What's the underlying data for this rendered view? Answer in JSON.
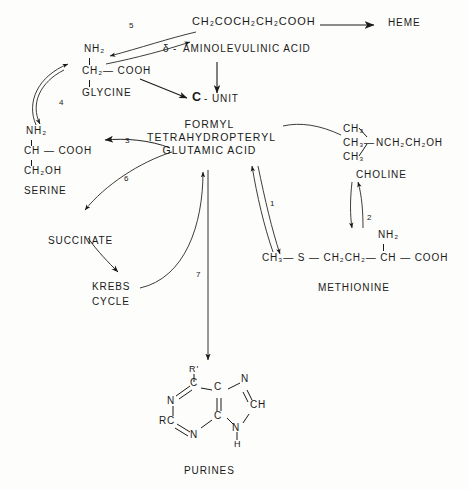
{
  "diagram": {
    "background_color": "#fdfdfb",
    "ink_color": "#1a1a1a"
  },
  "nodes": {
    "ala_formula": "CH₂COCH₂CH₂COOH",
    "ala_name_delta": "δ",
    "ala_name_dash": "-",
    "ala_name": "AMINOLEVULINIC ACID",
    "heme": "HEME",
    "glycine_nh2": "NH₂",
    "glycine_body": "CH₂— COOH",
    "glycine_name": "GLYCINE",
    "c_unit_c": "C",
    "c_unit_rest": "- UNIT",
    "serine_nh2": "NH₂",
    "serine_body": "CH — COOH",
    "serine_tail": "CH₂OH",
    "serine_name": "SERINE",
    "center_line1": "FORMYL",
    "center_line2": "TETRAHYDROPTERYL",
    "center_line3": "GLUTAMIC ACID",
    "choline_ch3_1": "CH₃",
    "choline_ch3_2": "CH₃",
    "choline_ch3_3": "CH₃",
    "choline_bond": "—",
    "choline_n_group": "NCH₂CH₂OH",
    "choline_name": "CHOLINE",
    "methionine_nh2": "NH₂",
    "methionine_body": "CH₃— S — CH₂CH₂— CH — COOH",
    "methionine_name": "METHIONINE",
    "succinate": "SUCCINATE",
    "krebs_line1": "KREBS",
    "krebs_line2": "CYCLE",
    "purines_name": "PURINES"
  },
  "purine_ring": {
    "r_prime": "R'",
    "c_top": "C",
    "c_fusion_top": "C",
    "n_upper_right": "N",
    "n_upper_left": "N",
    "ch_right": "CH",
    "rc_left": "RC",
    "n_lower_left": "N",
    "c_fusion_bottom": "C",
    "n_lower_right": "N",
    "h_bottom": "H"
  },
  "arrow_labels": {
    "one": "1",
    "two": "2",
    "three": "3",
    "four": "4",
    "five": "5",
    "six": "6",
    "seven": "7"
  }
}
